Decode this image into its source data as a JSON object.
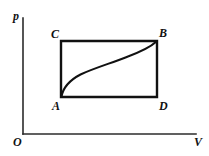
{
  "figure": {
    "kind": "pv-diagram",
    "background_color": "#ffffff",
    "line_color": "#111111",
    "axis_color": "#2b2b2b",
    "width": 209,
    "height": 156
  },
  "axes": {
    "vertical_label": "p",
    "horizontal_label": "V",
    "origin_label": "O",
    "vertical_axis": {
      "x": 23,
      "y_top": 18,
      "y_bottom": 134
    },
    "horizontal_axis": {
      "y": 134,
      "x_left": 23,
      "x_right": 196
    }
  },
  "vertices": {
    "A": {
      "label": "A",
      "x": 61,
      "y": 97
    },
    "B": {
      "label": "B",
      "x": 157,
      "y": 41
    },
    "C": {
      "label": "C",
      "x": 61,
      "y": 41
    },
    "D": {
      "label": "D",
      "x": 157,
      "y": 97
    }
  },
  "chart_data": {
    "type": "line",
    "title": "",
    "xlabel": "V",
    "ylabel": "p",
    "grid": false,
    "legend": null,
    "xlim": [
      0,
      209
    ],
    "ylim": [
      0,
      156
    ],
    "annotations": [
      "A",
      "B",
      "C",
      "D",
      "O",
      "p",
      "V"
    ],
    "series": [
      {
        "name": "rectangle-cycle-ACBD",
        "kind": "closed-rectangle",
        "points": [
          [
            61,
            97
          ],
          [
            61,
            41
          ],
          [
            157,
            41
          ],
          [
            157,
            97
          ],
          [
            61,
            97
          ]
        ]
      },
      {
        "name": "process-curve-A-to-B",
        "kind": "s-curve",
        "points": [
          [
            61,
            97
          ],
          [
            64,
            88
          ],
          [
            70,
            81
          ],
          [
            80,
            74
          ],
          [
            95,
            68
          ],
          [
            112,
            62
          ],
          [
            128,
            56
          ],
          [
            141,
            50
          ],
          [
            150,
            45
          ],
          [
            157,
            41
          ]
        ]
      }
    ]
  },
  "paths": {
    "rectangle": "M 61 97 L 61 41 L 157 41 L 157 97 Z",
    "curve": "M 61.5 96.5 C 63.5 86 70 80 80.5 74.5 C 93 68.5 110 63.5 125.5 57.5 C 139 52.5 149.5 48 156.5 41.5",
    "axis_vertical": "M 23 18 L 23 134",
    "axis_horizontal": "M 23 134 L 196 134"
  }
}
